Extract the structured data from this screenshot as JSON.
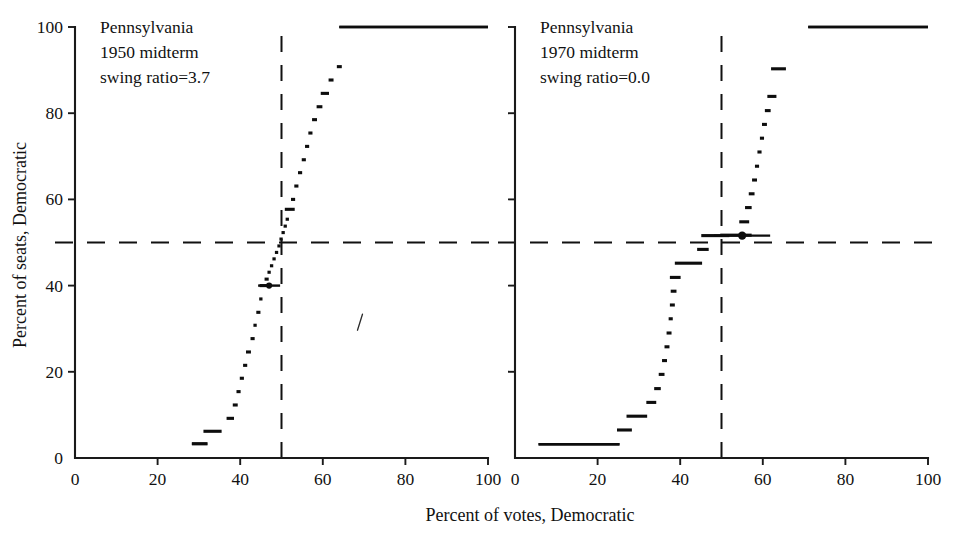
{
  "figure": {
    "width": 960,
    "height": 538,
    "background": "#ffffff",
    "ink_color": "#111111",
    "xlabel": "Percent  of  votes, Democratic",
    "ylabel": "Percent of seats, Democratic"
  },
  "axes": {
    "xlim": [
      0,
      100
    ],
    "ylim": [
      0,
      100
    ],
    "xticks": [
      0,
      20,
      40,
      60,
      80,
      100
    ],
    "yticks": [
      0,
      20,
      40,
      60,
      80,
      100
    ],
    "xticklabels": [
      "0",
      "20",
      "40",
      "60",
      "80",
      "100"
    ],
    "yticklabels": [
      "0",
      "20",
      "40",
      "60",
      "80",
      "100"
    ],
    "grid": false,
    "spines": "left-and-bottom-only",
    "reference_lines": {
      "vertical_votes_pct": 50,
      "horizontal_seats_pct": 50,
      "style": "dashed"
    }
  },
  "chart_data": [
    {
      "type": "line",
      "panel": "left",
      "title": "Pennsylvania",
      "subtitle": "1950 midterm",
      "annotation": "swing ratio=3.7",
      "annotation_lines": [
        "Pennsylvania",
        "1950 midterm",
        "swing ratio=3.7"
      ],
      "swing_ratio": 3.7,
      "xlabel": "Percent  of  votes, Democratic",
      "ylabel": "Percent of seats, Democratic",
      "xlim": [
        0,
        100
      ],
      "ylim": [
        0,
        100
      ],
      "series_name": "seats-votes curve",
      "style": "step-segments",
      "x": [
        30.2,
        33.3,
        37.6,
        38.8,
        39.6,
        40.4,
        41.2,
        42.0,
        43.0,
        43.6,
        44.4,
        45.0,
        45.8,
        46.4,
        47.0,
        47.6,
        48.2,
        48.8,
        49.4,
        49.9,
        50.4,
        50.9,
        51.4,
        52.0,
        52.8,
        53.6,
        54.5,
        55.4,
        56.2,
        57.0,
        58.0,
        59.2,
        60.5,
        62.0,
        64.0,
        82.0
      ],
      "y": [
        3.3,
        6.2,
        9.2,
        12.3,
        15.4,
        18.5,
        21.5,
        24.6,
        27.7,
        30.8,
        33.8,
        36.9,
        40.0,
        41.5,
        43.1,
        44.6,
        46.2,
        47.7,
        49.2,
        50.8,
        52.3,
        53.8,
        55.4,
        57.7,
        60.0,
        63.1,
        66.2,
        69.2,
        72.3,
        75.4,
        78.5,
        81.5,
        84.6,
        87.7,
        90.8,
        100.0
      ],
      "segment_halfwidths": [
        1.9,
        2.2,
        0.9,
        0.6,
        0.5,
        0.5,
        0.5,
        0.6,
        0.5,
        0.4,
        0.5,
        0.4,
        1.1,
        0.5,
        0.4,
        0.4,
        0.4,
        0.4,
        0.4,
        0.4,
        0.4,
        0.4,
        0.4,
        1.2,
        0.5,
        0.5,
        0.5,
        0.5,
        0.5,
        0.5,
        0.6,
        0.7,
        1.0,
        0.6,
        0.6,
        18.0
      ],
      "markers": [
        {
          "x": 47.0,
          "y": 40.0,
          "shape": "dot-with-bar",
          "label": "observed election"
        }
      ],
      "stray_mark": {
        "x": 69.0,
        "y": 31.5,
        "shape": "slash"
      },
      "top_plateau": {
        "y": 100,
        "x_from": 64.0,
        "x_to": 100.0
      },
      "bottom_plateau": {
        "y": 3.3,
        "x_from": 28.3,
        "x_to": 32.0
      }
    },
    {
      "type": "line",
      "panel": "right",
      "title": "Pennsylvania",
      "subtitle": "1970 midterm",
      "annotation": "swing ratio=0.0",
      "annotation_lines": [
        "Pennsylvania",
        "1970 midterm",
        "swing ratio=0.0"
      ],
      "swing_ratio": 0.0,
      "xlabel": "Percent  of  votes, Democratic",
      "ylabel": "Percent of seats, Democratic",
      "xlim": [
        0,
        100
      ],
      "ylim": [
        0,
        100
      ],
      "series_name": "seats-votes curve",
      "style": "step-segments",
      "x": [
        15.5,
        26.5,
        29.5,
        33.0,
        34.5,
        35.5,
        36.2,
        36.8,
        37.3,
        37.7,
        38.1,
        38.4,
        38.8,
        42.0,
        45.5,
        48.5,
        53.5,
        55.5,
        56.5,
        57.3,
        58.0,
        58.6,
        59.2,
        59.8,
        60.4,
        61.2,
        62.2,
        63.8,
        85.5
      ],
      "y": [
        3.2,
        6.5,
        9.7,
        12.9,
        16.1,
        19.4,
        22.6,
        25.8,
        29.0,
        32.3,
        35.5,
        38.7,
        41.9,
        45.2,
        48.4,
        51.6,
        51.7,
        54.8,
        58.1,
        61.3,
        64.5,
        67.7,
        71.0,
        74.2,
        77.4,
        80.6,
        83.9,
        90.3,
        100.0
      ],
      "segment_halfwidths": [
        9.8,
        1.8,
        2.5,
        1.2,
        0.8,
        0.7,
        0.6,
        0.6,
        0.6,
        0.5,
        0.6,
        0.7,
        1.3,
        3.3,
        1.4,
        3.4,
        3.8,
        1.2,
        0.8,
        0.7,
        0.6,
        0.5,
        0.5,
        0.5,
        0.6,
        0.7,
        1.1,
        1.8,
        14.5
      ],
      "markers": [
        {
          "x": 55.0,
          "y": 51.6,
          "shape": "dot-with-bar",
          "label": "observed election"
        }
      ],
      "top_plateau": {
        "y": 100,
        "x_from": 71.0,
        "x_to": 100.0
      },
      "bottom_plateau": {
        "y": 3.2,
        "x_from": 5.7,
        "x_to": 25.3
      }
    }
  ]
}
